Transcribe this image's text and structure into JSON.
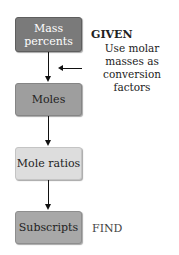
{
  "diagram": {
    "steps": [
      {
        "label": "Mass percents",
        "color": "#7a7a7a"
      },
      {
        "label": "Moles",
        "color": "#9e9e9e"
      },
      {
        "label": "Mole ratios",
        "color": "#dddddd"
      },
      {
        "label": "Subscripts",
        "color": "#a8a8a8"
      }
    ],
    "annotations": {
      "given": "GIVEN",
      "find": "FIND",
      "note": "Use molar masses as conversion factors"
    }
  }
}
